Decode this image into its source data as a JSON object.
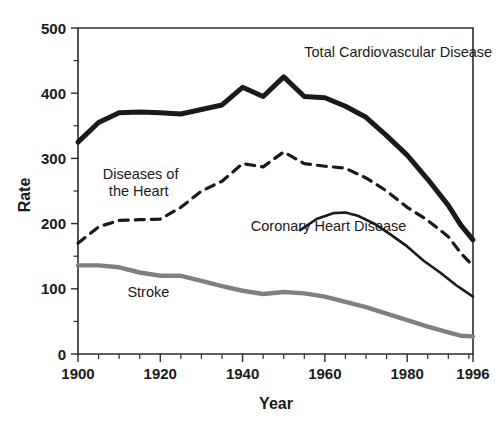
{
  "chart_data": {
    "type": "line",
    "title": "",
    "xlabel": "Year",
    "ylabel": "Rate",
    "xlim": [
      1900,
      1996
    ],
    "ylim": [
      0,
      500
    ],
    "grid": false,
    "legend_position": "inline-annotations",
    "x_ticks_major": [
      1900,
      1920,
      1940,
      1960,
      1980,
      1996
    ],
    "x_tick_labels": [
      "1900",
      "1920",
      "1940",
      "1960",
      "1980",
      "1996"
    ],
    "x_ticks_minor_step": 5,
    "y_ticks_major": [
      0,
      100,
      200,
      300,
      400,
      500
    ],
    "y_tick_labels": [
      "0",
      "100",
      "200",
      "300",
      "400",
      "500"
    ],
    "y_ticks_minor_step": 50,
    "series": [
      {
        "name": "Total Cardiovascular Disease",
        "style": "solid",
        "color": "#1a1a1a",
        "width": 5,
        "label_x": 1955,
        "label_y": 455,
        "label_anchor": "start",
        "x": [
          1900,
          1905,
          1910,
          1915,
          1920,
          1925,
          1930,
          1935,
          1940,
          1945,
          1950,
          1955,
          1960,
          1965,
          1970,
          1975,
          1980,
          1985,
          1990,
          1993,
          1996
        ],
        "y": [
          325,
          355,
          370,
          371,
          370,
          368,
          375,
          382,
          409,
          395,
          425,
          395,
          393,
          380,
          363,
          335,
          305,
          268,
          228,
          198,
          175
        ]
      },
      {
        "name": "Diseases of the Heart",
        "style": "dashed",
        "color": "#1a1a1a",
        "width": 3.2,
        "label_x": 1906,
        "label_y": 268,
        "label_anchor": "start",
        "x": [
          1900,
          1905,
          1910,
          1915,
          1920,
          1925,
          1930,
          1935,
          1940,
          1945,
          1950,
          1955,
          1960,
          1965,
          1970,
          1975,
          1980,
          1985,
          1990,
          1993,
          1996
        ],
        "y": [
          170,
          195,
          205,
          206,
          207,
          225,
          250,
          265,
          292,
          287,
          310,
          292,
          288,
          285,
          270,
          250,
          225,
          205,
          180,
          155,
          135
        ]
      },
      {
        "name": "Coronary Heart Disease",
        "style": "solid",
        "color": "#1a1a1a",
        "width": 2.6,
        "label_x": 1942,
        "label_y": 188,
        "label_anchor": "start",
        "x": [
          1954,
          1958,
          1962,
          1965,
          1968,
          1972,
          1976,
          1980,
          1984,
          1988,
          1992,
          1996
        ],
        "y": [
          190,
          207,
          216,
          217,
          212,
          200,
          183,
          165,
          143,
          125,
          105,
          88
        ]
      },
      {
        "name": "Stroke",
        "style": "solid",
        "color": "#808080",
        "width": 4.4,
        "label_x": 1912,
        "label_y": 87,
        "label_anchor": "start",
        "x": [
          1900,
          1905,
          1910,
          1915,
          1920,
          1925,
          1930,
          1935,
          1940,
          1945,
          1950,
          1955,
          1960,
          1965,
          1970,
          1975,
          1980,
          1985,
          1990,
          1993,
          1996
        ],
        "y": [
          136,
          136,
          133,
          125,
          120,
          120,
          112,
          104,
          97,
          92,
          95,
          93,
          88,
          80,
          72,
          62,
          52,
          42,
          33,
          28,
          27
        ]
      }
    ]
  },
  "axes": {
    "y_title": "Rate",
    "x_title": "Year"
  }
}
